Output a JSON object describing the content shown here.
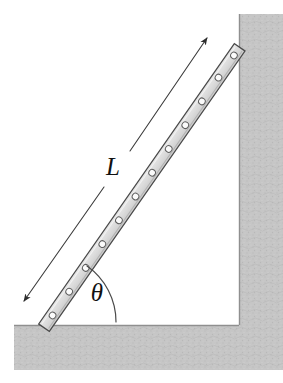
{
  "figure": {
    "background_color": "#ffffff"
  },
  "labels": {
    "length_label": "L",
    "angle_label": "θ"
  },
  "colors": {
    "wall_fill": "#c6c6c6",
    "floor_fill": "#c6c6c6",
    "surface_edge": "#8f8f8f",
    "ladder_fill": "#dcdcdc",
    "ladder_stroke": "#4a4a4a",
    "rivet_fill": "#fbfbfb",
    "rivet_stroke": "#5e5e5e",
    "dimension_line": "#3c3c3c",
    "arc_line": "#4a4a4a",
    "text": "#111111"
  },
  "geometry": {
    "wall": {
      "left_edge_x": 239,
      "top_y": 14,
      "right_x": 283,
      "bottom_y": 370
    },
    "floor": {
      "left_x": 14,
      "top_y": 325,
      "right_x": 283,
      "bottom_y": 370
    },
    "ladder": {
      "bottom_end": {
        "x": 48,
        "y": 322
      },
      "top_end": {
        "x": 239,
        "y": 48
      },
      "width_px": 13,
      "rivet_count": 12
    },
    "dimension_line": {
      "lower_arrow_tip": {
        "x": 22,
        "y": 303
      },
      "upper_arrow_tip": {
        "x": 209,
        "y": 36
      },
      "gap_for_label": true
    },
    "angle_arc": {
      "vertex": {
        "x": 48,
        "y": 322
      },
      "radius_px": 68,
      "from_deg": 0,
      "to_deg": 55
    }
  },
  "text_positions": {
    "L": {
      "x": 113,
      "y": 175
    },
    "theta": {
      "x": 97,
      "y": 301
    }
  }
}
